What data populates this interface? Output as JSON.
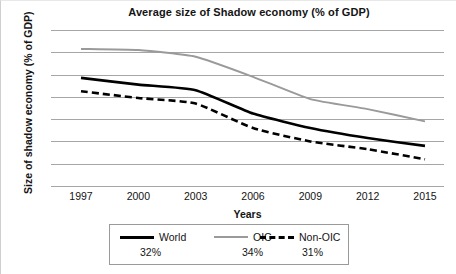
{
  "chart_data": {
    "type": "line",
    "title": "Average size of Shadow economy (% of GDP)",
    "xlabel": "Years",
    "ylabel": "Size of shadow economy (% of GDP)",
    "categories": [
      "1997",
      "2000",
      "2003",
      "2006",
      "2009",
      "2012",
      "2015"
    ],
    "x_tick_labels": [
      "1997",
      "2000",
      "2003",
      "2006",
      "2009",
      "2012",
      "2015"
    ],
    "y_tick_labels": [
      "39",
      "37",
      "35",
      "33",
      "31",
      "29",
      "27",
      "25"
    ],
    "ylim": [
      25,
      39
    ],
    "ytick_step": 2,
    "grid": "horizontal",
    "legend_position": "below-axis",
    "series": [
      {
        "name": "World",
        "average_label": "32%",
        "style": "solid",
        "color": "#000000",
        "width": 2.6,
        "values": [
          34.7,
          34.1,
          33.6,
          31.5,
          30.2,
          29.3,
          28.6
        ]
      },
      {
        "name": "OIC",
        "average_label": "34%",
        "style": "solid",
        "color": "#9a9a9a",
        "width": 1.9,
        "values": [
          37.3,
          37.2,
          36.6,
          34.8,
          32.8,
          31.9,
          30.8
        ]
      },
      {
        "name": "Non-OIC",
        "average_label": "31%",
        "style": "dashed",
        "color": "#000000",
        "width": 2.6,
        "values": [
          33.5,
          32.9,
          32.4,
          30.2,
          29.0,
          28.3,
          27.4
        ]
      }
    ]
  },
  "legend": {
    "entries": [
      {
        "label": "World",
        "value": "32%"
      },
      {
        "label": "OIC",
        "value": "34%"
      },
      {
        "label": "Non-OIC",
        "value": "31%"
      }
    ]
  },
  "colors": {
    "gridline": "#a6a6a6",
    "world_line": "#000000",
    "oic_line": "#9a9a9a",
    "non_oic_line": "#000000",
    "text": "#141414",
    "legend_border": "#9a9a9a",
    "background": "#ffffff"
  }
}
